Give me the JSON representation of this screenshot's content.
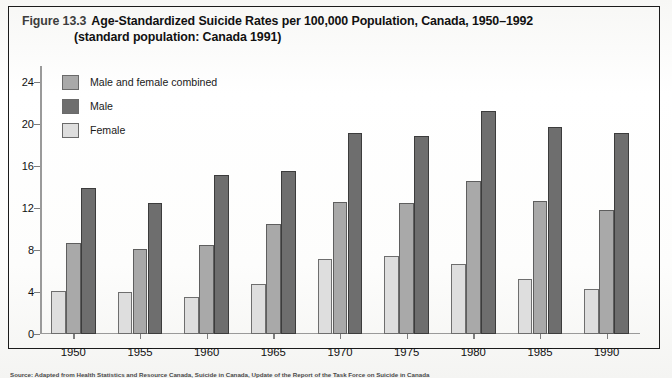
{
  "figure": {
    "label": "Figure 13.3",
    "title_line1": "Age-Standardized Suicide Rates per 100,000 Population, Canada, 1950–1992",
    "title_line2": "(standard population: Canada 1991)",
    "source_note": "Source: Adapted from Health Statistics and Resource Canada, Suicide in Canada, Update of the Report of the Task Force on Suicide in Canada"
  },
  "legend": {
    "position": "top-left-inside-plot",
    "items": [
      {
        "label": "Male and female combined",
        "color": "#a9a9a9",
        "key": "combined"
      },
      {
        "label": "Male",
        "color": "#6e6e6e",
        "key": "male"
      },
      {
        "label": "Female",
        "color": "#dedede",
        "key": "female"
      }
    ]
  },
  "chart_data": {
    "type": "bar",
    "title": "Age-Standardized Suicide Rates per 100,000 Population, Canada, 1950–1992 (standard population: Canada 1991)",
    "xlabel": "",
    "ylabel": "",
    "categories": [
      "1950",
      "1955",
      "1960",
      "1965",
      "1970",
      "1975",
      "1980",
      "1985",
      "1990"
    ],
    "series": [
      {
        "name": "Female",
        "color": "#dedede",
        "values": [
          4.1,
          4.0,
          3.5,
          4.8,
          7.1,
          7.4,
          6.7,
          5.2,
          4.3
        ]
      },
      {
        "name": "Male and female combined",
        "color": "#a9a9a9",
        "values": [
          8.7,
          8.1,
          8.5,
          10.5,
          12.6,
          12.5,
          14.6,
          12.7,
          11.8
        ]
      },
      {
        "name": "Male",
        "color": "#6e6e6e",
        "values": [
          13.9,
          12.5,
          15.1,
          15.5,
          19.1,
          18.8,
          21.2,
          19.7,
          19.1
        ]
      }
    ],
    "yticks": [
      0,
      4,
      8,
      12,
      16,
      20,
      24
    ],
    "ylim": [
      0,
      25.5
    ],
    "grid": false,
    "legend_position": "top-left"
  }
}
